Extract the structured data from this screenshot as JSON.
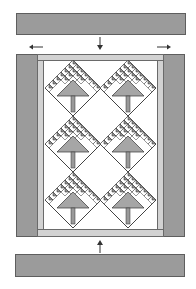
{
  "diagram": {
    "type": "quilt-assembly",
    "colors": {
      "border_fill": "#9b9b9b",
      "border_stroke": "#5e5e5e",
      "sashing_fill": "#d2d2d2",
      "tree_dark": "#8f8f8f",
      "tree_mid": "#b5b5b5",
      "background": "#ffffff",
      "line": "#333333"
    },
    "top_border": {
      "label": ""
    },
    "bottom_border": {
      "label": ""
    },
    "left_border": {
      "label": ""
    },
    "right_border": {
      "label": ""
    },
    "arrows": [
      {
        "id": "top",
        "direction": "down"
      },
      {
        "id": "bottom",
        "direction": "up"
      },
      {
        "id": "left",
        "direction": "left"
      },
      {
        "id": "right",
        "direction": "right"
      }
    ],
    "blocks": {
      "rows": 3,
      "columns": 2,
      "motif": "pine-tree-on-point",
      "count": 6
    }
  }
}
